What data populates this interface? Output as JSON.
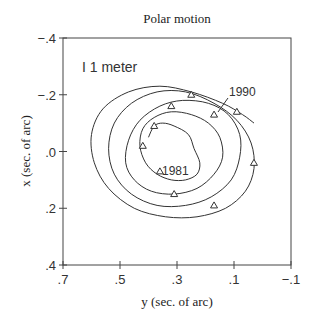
{
  "chart_data": {
    "type": "line",
    "title": "Polar motion",
    "xlabel": "y (sec. of arc)",
    "ylabel": "x (sec. of arc)",
    "x_axis": {
      "range": [
        0.7,
        -0.1
      ],
      "reversed": true,
      "ticks": [
        0.7,
        0.5,
        0.3,
        0.1,
        -0.1
      ],
      "tick_labels": [
        ".7",
        ".5",
        ".3",
        ".1",
        "−.1"
      ]
    },
    "y_axis": {
      "range": [
        -0.4,
        0.4
      ],
      "reversed": true,
      "ticks": [
        -0.4,
        -0.2,
        0.0,
        0.2,
        0.4
      ],
      "tick_labels": [
        "−.4",
        "−.2",
        ".0",
        ".2",
        ".4"
      ]
    },
    "grid": false,
    "legend": null,
    "annotations": [
      {
        "text": "I 1 meter",
        "kind": "scale-bar",
        "y": 0.63,
        "x": -0.33
      },
      {
        "text": "1981",
        "kind": "start-label",
        "y": 0.28,
        "x": 0.02
      },
      {
        "text": "1990",
        "kind": "end-label",
        "y": 0.12,
        "x": -0.18
      }
    ],
    "series": [
      {
        "name": "Pole path 1981-1990",
        "style": "spiral-line",
        "points_y": [
          0.4,
          0.38,
          0.35,
          0.31,
          0.26,
          0.24,
          0.22,
          0.23,
          0.27,
          0.32,
          0.37,
          0.41,
          0.43,
          0.42,
          0.38,
          0.32,
          0.25,
          0.19,
          0.15,
          0.14,
          0.17,
          0.23,
          0.31,
          0.39,
          0.45,
          0.48,
          0.47,
          0.43,
          0.36,
          0.28,
          0.19,
          0.12,
          0.08,
          0.08,
          0.11,
          0.18,
          0.27,
          0.37,
          0.46,
          0.52,
          0.54,
          0.52,
          0.46,
          0.37,
          0.27,
          0.17,
          0.09,
          0.04,
          0.03,
          0.06,
          0.13,
          0.23,
          0.34,
          0.45,
          0.54,
          0.59,
          0.6,
          0.56,
          0.47,
          0.36,
          0.25,
          0.14,
          0.07,
          0.03
        ],
        "points_x": [
          -0.05,
          -0.09,
          -0.1,
          -0.09,
          -0.06,
          -0.01,
          0.04,
          0.08,
          0.1,
          0.1,
          0.08,
          0.04,
          -0.02,
          -0.08,
          -0.12,
          -0.14,
          -0.13,
          -0.1,
          -0.05,
          0.02,
          0.08,
          0.13,
          0.15,
          0.14,
          0.1,
          0.04,
          -0.04,
          -0.11,
          -0.16,
          -0.18,
          -0.17,
          -0.13,
          -0.06,
          0.02,
          0.1,
          0.16,
          0.19,
          0.19,
          0.15,
          0.08,
          -0.01,
          -0.1,
          -0.17,
          -0.21,
          -0.21,
          -0.17,
          -0.11,
          -0.03,
          0.06,
          0.14,
          0.2,
          0.23,
          0.23,
          0.2,
          0.13,
          0.04,
          -0.06,
          -0.15,
          -0.21,
          -0.23,
          -0.21,
          -0.17,
          -0.13,
          -0.1
        ]
      },
      {
        "name": "Yearly markers",
        "style": "triangle-markers",
        "points_y": [
          0.36,
          0.42,
          0.38,
          0.32,
          0.25,
          0.17,
          0.09,
          0.03,
          0.17,
          0.31
        ],
        "points_x": [
          0.07,
          -0.02,
          -0.09,
          -0.16,
          -0.2,
          -0.13,
          -0.14,
          0.04,
          0.19,
          0.15
        ]
      }
    ]
  }
}
